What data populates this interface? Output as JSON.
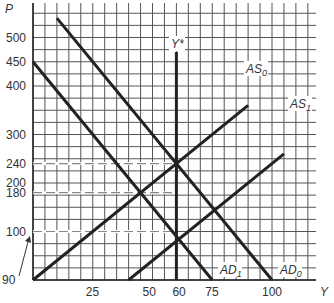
{
  "chart_data": {
    "type": "line",
    "title": "",
    "xlabel": "Y",
    "ylabel": "P",
    "xlim": [
      0,
      118
    ],
    "ylim": [
      0,
      570
    ],
    "grid": true,
    "x_ticks": [
      25,
      50,
      60,
      75,
      100
    ],
    "y_ticks": [
      90,
      100,
      180,
      200,
      240,
      300,
      400,
      450,
      500
    ],
    "series": [
      {
        "name": "AD0",
        "label_main": "AD",
        "label_sub": "0",
        "points": [
          [
            10,
            540
          ],
          [
            100,
            0
          ]
        ]
      },
      {
        "name": "AD1",
        "label_main": "AD",
        "label_sub": "1",
        "points": [
          [
            0,
            450
          ],
          [
            75,
            0
          ]
        ]
      },
      {
        "name": "AS0",
        "label_main": "AS",
        "label_sub": "0",
        "points": [
          [
            0,
            0
          ],
          [
            90,
            360
          ]
        ]
      },
      {
        "name": "AS1",
        "label_main": "AS",
        "label_sub": "1",
        "points": [
          [
            40,
            0
          ],
          [
            105,
            260
          ]
        ]
      },
      {
        "name": "Y*",
        "label_main": "Y*",
        "points": [
          [
            60,
            0
          ],
          [
            60,
            470
          ]
        ]
      }
    ],
    "reference_lines": [
      {
        "axis": "y",
        "value": 240,
        "style": "dashed"
      },
      {
        "axis": "y",
        "value": 180,
        "style": "dashed"
      },
      {
        "axis": "y",
        "value": 100,
        "style": "dashed"
      }
    ],
    "annotations": [
      {
        "text": "90",
        "type": "arrow",
        "points_to": [
          0,
          90
        ]
      }
    ]
  }
}
